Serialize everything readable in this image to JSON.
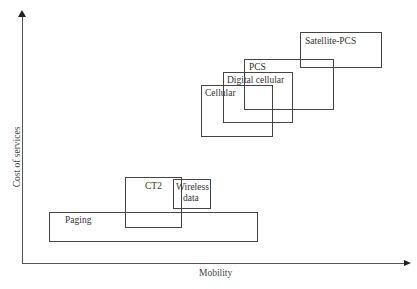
{
  "axes": {
    "y_label": "Cost of services",
    "x_label": "Mobility"
  },
  "boxes": [
    {
      "name": "Paging",
      "label": "Paging"
    },
    {
      "name": "CT2",
      "label": "CT2"
    },
    {
      "name": "Wireless data",
      "label_line1": "Wireless",
      "label_line2": "data"
    },
    {
      "name": "Cellular",
      "label": "Cellular"
    },
    {
      "name": "Digital cellular",
      "label": "Digital cellular"
    },
    {
      "name": "PCS",
      "label": "PCS"
    },
    {
      "name": "Satellite-PCS",
      "label": "Satellite-PCS"
    }
  ]
}
